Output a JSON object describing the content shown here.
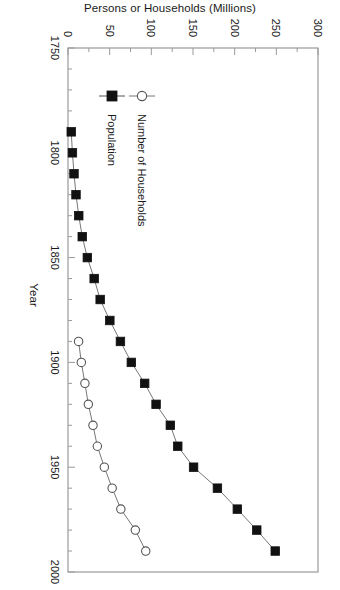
{
  "chart_data": {
    "type": "line",
    "title": "",
    "xlabel": "Year",
    "ylabel": "Persons or Households (Millions)",
    "xlim": [
      1750,
      2000
    ],
    "ylim": [
      0,
      300
    ],
    "xticks": [
      1750,
      1800,
      1850,
      1900,
      1950,
      2000
    ],
    "xtick_labels": [
      "1750",
      "1800",
      "1850",
      "1900",
      "1950",
      "2000"
    ],
    "yticks": [
      0,
      50,
      100,
      150,
      200,
      250,
      300
    ],
    "ytick_labels": [
      "0",
      "50",
      "100",
      "150",
      "200",
      "250",
      "300"
    ],
    "x_minor_tick_step": 10,
    "y_minor_tick_step": 25,
    "grid": false,
    "legend_position": "lower-left-inside",
    "series": [
      {
        "name": "Population",
        "marker": "filled-square",
        "color": "#111111",
        "line_color": "#777777",
        "points": [
          {
            "x": 1790,
            "y": 3.9
          },
          {
            "x": 1800,
            "y": 5.3
          },
          {
            "x": 1810,
            "y": 7.2
          },
          {
            "x": 1820,
            "y": 9.6
          },
          {
            "x": 1830,
            "y": 12.9
          },
          {
            "x": 1840,
            "y": 17.1
          },
          {
            "x": 1850,
            "y": 23.2
          },
          {
            "x": 1860,
            "y": 31.4
          },
          {
            "x": 1870,
            "y": 38.6
          },
          {
            "x": 1880,
            "y": 50.2
          },
          {
            "x": 1890,
            "y": 62.9
          },
          {
            "x": 1900,
            "y": 76.0
          },
          {
            "x": 1910,
            "y": 92.0
          },
          {
            "x": 1920,
            "y": 105.7
          },
          {
            "x": 1930,
            "y": 122.8
          },
          {
            "x": 1940,
            "y": 131.7
          },
          {
            "x": 1950,
            "y": 150.7
          },
          {
            "x": 1960,
            "y": 179.3
          },
          {
            "x": 1970,
            "y": 203.2
          },
          {
            "x": 1980,
            "y": 226.5
          },
          {
            "x": 1990,
            "y": 248.7
          }
        ]
      },
      {
        "name": "Number of Households",
        "marker": "open-circle",
        "color": "#555555",
        "line_color": "#777777",
        "points": [
          {
            "x": 1890,
            "y": 12.7
          },
          {
            "x": 1900,
            "y": 16.0
          },
          {
            "x": 1910,
            "y": 20.3
          },
          {
            "x": 1920,
            "y": 24.4
          },
          {
            "x": 1930,
            "y": 30.0
          },
          {
            "x": 1940,
            "y": 35.2
          },
          {
            "x": 1950,
            "y": 43.6
          },
          {
            "x": 1960,
            "y": 53.0
          },
          {
            "x": 1970,
            "y": 63.4
          },
          {
            "x": 1980,
            "y": 80.8
          },
          {
            "x": 1990,
            "y": 93.3
          }
        ]
      }
    ]
  },
  "legend": {
    "entries": [
      {
        "label": "Population",
        "marker": "filled-square"
      },
      {
        "label": "Number of Households",
        "marker": "open-circle"
      }
    ]
  }
}
